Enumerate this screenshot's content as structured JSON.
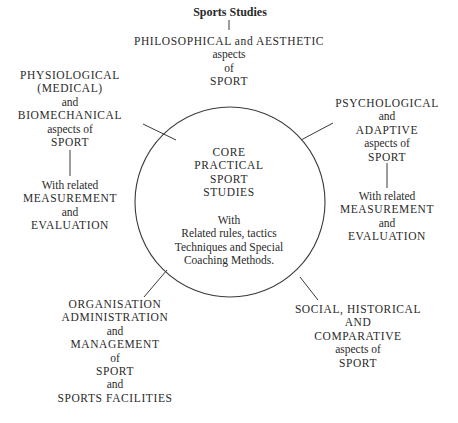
{
  "diagram": {
    "title": "Sports Studies",
    "center": {
      "heading": [
        "CORE",
        "PRACTICAL",
        "SPORT",
        "STUDIES"
      ],
      "body": [
        "With",
        "Related rules, tactics",
        "Techniques and Special",
        "Coaching Methods."
      ]
    },
    "nodes": {
      "top": [
        "PHILOSOPHICAL and AESTHETIC",
        "aspects",
        "of",
        "SPORT"
      ],
      "top_left": [
        "PHYSIOLOGICAL",
        "(MEDICAL)",
        "and",
        "BIOMECHANICAL",
        "aspects of",
        "SPORT"
      ],
      "top_left_sub": [
        "With related",
        "MEASUREMENT",
        "and",
        "EVALUATION"
      ],
      "top_right": [
        "PSYCHOLOGICAL",
        "and",
        "ADAPTIVE",
        "aspects of",
        "SPORT"
      ],
      "top_right_sub": [
        "With related",
        "MEASUREMENT",
        "and",
        "EVALUATION"
      ],
      "bottom_left": [
        "ORGANISATION",
        "ADMINISTRATION",
        "and",
        "MANAGEMENT",
        "of",
        "SPORT",
        "and",
        "SPORTS FACILITIES"
      ],
      "bottom_right": [
        "SOCIAL, HISTORICAL",
        "AND",
        "COMPARATIVE",
        "aspects of",
        "SPORT"
      ]
    },
    "colors": {
      "ink": "#2a2a2a",
      "background": "#ffffff"
    }
  }
}
